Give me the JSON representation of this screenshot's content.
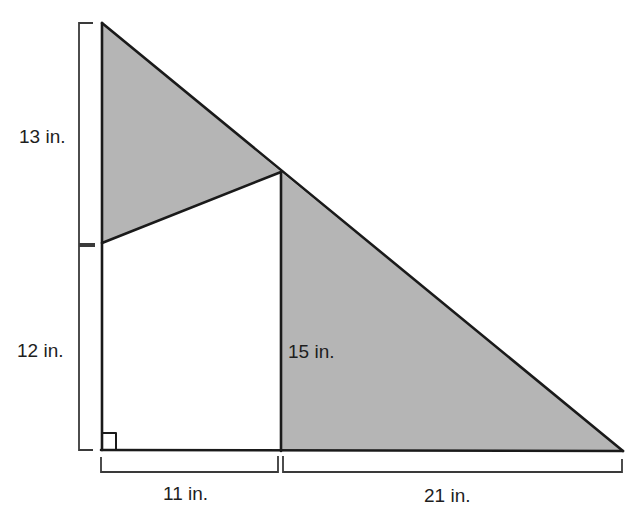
{
  "diagram": {
    "type": "geometry-figure",
    "colors": {
      "background": "#ffffff",
      "shaded_fill": "#b5b5b5",
      "line": "#1a1a1a",
      "label_text": "#1e1e1e"
    },
    "labels": {
      "left_upper": "13 in.",
      "left_lower": "12 in.",
      "inner_vertical": "15 in.",
      "bottom_left": "11 in.",
      "bottom_right": "21 in."
    },
    "regions": [
      {
        "name": "upper-shaded-triangle",
        "shaded": true
      },
      {
        "name": "lower-left-quadrilateral",
        "shaded": false
      },
      {
        "name": "right-shaded-triangle",
        "shaded": true
      }
    ],
    "markers": {
      "right_angle": "bottom-left corner"
    }
  }
}
